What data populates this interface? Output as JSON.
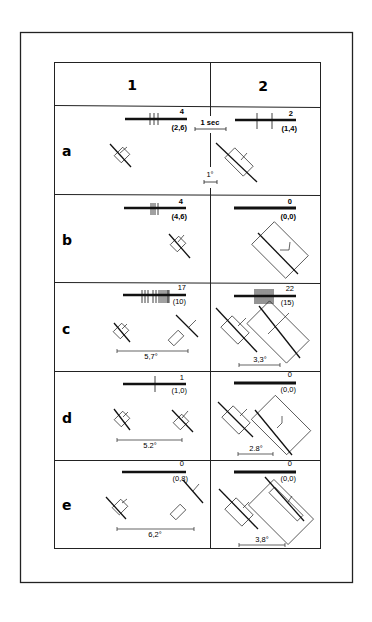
{
  "figure": {
    "columns": [
      "1",
      "2"
    ],
    "calibration": {
      "time_label": "1 sec",
      "angle_label": "1°"
    },
    "rows": [
      {
        "label": "a",
        "cells": [
          {
            "spike_count": "4",
            "rate": "(2,6)",
            "angle": ""
          },
          {
            "spike_count": "2",
            "rate": "(1,4)",
            "angle": ""
          }
        ]
      },
      {
        "label": "b",
        "cells": [
          {
            "spike_count": "4",
            "rate": "(4,6)",
            "angle": ""
          },
          {
            "spike_count": "0",
            "rate": "(0,0)",
            "angle": ""
          }
        ]
      },
      {
        "label": "c",
        "cells": [
          {
            "spike_count": "17",
            "rate": "(10)",
            "angle": "5,7°"
          },
          {
            "spike_count": "22",
            "rate": "(15)",
            "angle": "3,3°"
          }
        ]
      },
      {
        "label": "d",
        "cells": [
          {
            "spike_count": "1",
            "rate": "(1,0)",
            "angle": "5.2°"
          },
          {
            "spike_count": "0",
            "rate": "(0,0)",
            "angle": "2.8°"
          }
        ]
      },
      {
        "label": "e",
        "cells": [
          {
            "spike_count": "0",
            "rate": "(0,8)",
            "angle": "6,2°"
          },
          {
            "spike_count": "0",
            "rate": "(0,0)",
            "angle": "3,8°"
          }
        ]
      }
    ]
  }
}
